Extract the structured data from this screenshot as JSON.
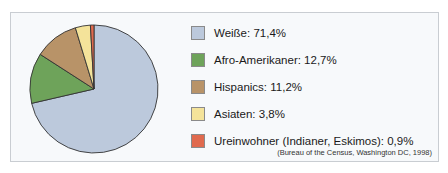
{
  "chart_data": {
    "type": "pie",
    "title": "",
    "categories": [
      "Weiße",
      "Afro-Amerikaner",
      "Hispanics",
      "Asiaten",
      "Ureinwohner (Indianer, Eskimos)"
    ],
    "values": [
      71.4,
      12.7,
      11.2,
      3.8,
      0.9
    ],
    "colors": [
      "#bcc9dc",
      "#6ea35a",
      "#b89368",
      "#f4e39a",
      "#e06a4e"
    ],
    "legend_position": "right",
    "source": "(Bureau of the Census, Washington DC, 1998)"
  },
  "legend": {
    "items": [
      {
        "label": "Weiße: 71,4%",
        "color": "#bcc9dc"
      },
      {
        "label": "Afro-Amerikaner: 12,7%",
        "color": "#6ea35a"
      },
      {
        "label": "Hispanics: 11,2%",
        "color": "#b89368"
      },
      {
        "label": "Asiaten: 3,8%",
        "color": "#f4e39a"
      },
      {
        "label": "Ureinwohner (Indianer, Eskimos): 0,9%",
        "color": "#e06a4e"
      }
    ]
  },
  "source": "(Bureau of the Census, Washington DC, 1998)"
}
